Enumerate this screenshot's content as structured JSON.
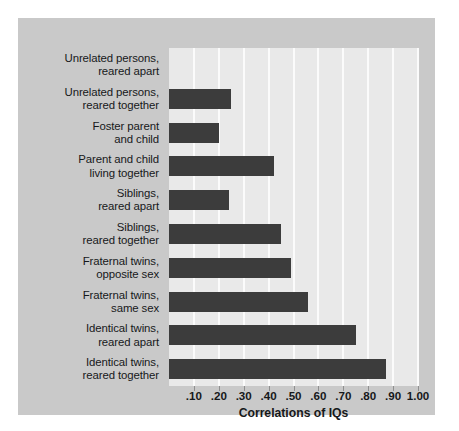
{
  "chart_data": {
    "type": "bar",
    "orientation": "horizontal",
    "title": "",
    "xlabel": "Correlations of IQs",
    "ylabel": "",
    "xlim": [
      0,
      1.0
    ],
    "grid": true,
    "legend": false,
    "xticks": [
      0.1,
      0.2,
      0.3,
      0.4,
      0.5,
      0.6,
      0.7,
      0.8,
      0.9,
      1.0
    ],
    "xticklabels": [
      ".10",
      ".20",
      ".30",
      ".40",
      ".50",
      ".60",
      ".70",
      ".80",
      ".90",
      "1.00"
    ],
    "categories": [
      "Unrelated persons, reared apart",
      "Unrelated persons, reared together",
      "Foster parent and child",
      "Parent and child living together",
      "Siblings, reared apart",
      "Siblings, reared together",
      "Fraternal twins, opposite sex",
      "Fraternal twins, same sex",
      "Identical twins, reared apart",
      "Identical twins, reared together"
    ],
    "values": [
      0.0,
      0.25,
      0.2,
      0.42,
      0.24,
      0.45,
      0.49,
      0.56,
      0.75,
      0.87
    ]
  },
  "axis": {
    "title": "Correlations of IQs",
    "ticklabels": [
      ".10",
      ".20",
      ".30",
      ".40",
      ".50",
      ".60",
      ".70",
      ".80",
      ".90",
      "1.00"
    ]
  },
  "categories": [
    {
      "line1": "Unrelated persons,",
      "line2": "reared apart"
    },
    {
      "line1": "Unrelated persons,",
      "line2": "reared together"
    },
    {
      "line1": "Foster parent",
      "line2": "and child"
    },
    {
      "line1": "Parent and child",
      "line2": "living together"
    },
    {
      "line1": "Siblings,",
      "line2": "reared apart"
    },
    {
      "line1": "Siblings,",
      "line2": "reared together"
    },
    {
      "line1": "Fraternal twins,",
      "line2": "opposite sex"
    },
    {
      "line1": "Fraternal twins,",
      "line2": "same sex"
    },
    {
      "line1": "Identical twins,",
      "line2": "reared apart"
    },
    {
      "line1": "Identical twins,",
      "line2": "reared together"
    }
  ],
  "colors": {
    "panel_background": "#c9c9c9",
    "plot_background": "#e9e9e9",
    "gridline": "#fbfbfb",
    "bar": "#3c3c3c",
    "text": "#16181a",
    "page_background": "#ffffff"
  }
}
